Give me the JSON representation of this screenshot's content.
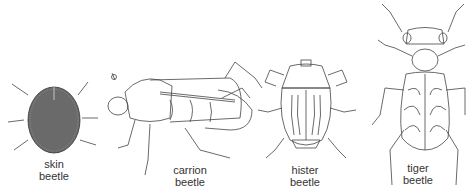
{
  "figure": {
    "beetles": [
      {
        "id": "skin",
        "line1": "skin",
        "line2": "beetle"
      },
      {
        "id": "carrion",
        "line1": "carrion",
        "line2": "beetle"
      },
      {
        "id": "hister",
        "line1": "hister",
        "line2": "beetle"
      },
      {
        "id": "tiger",
        "line1": "tiger",
        "line2": "beetle"
      }
    ],
    "colors": {
      "line": "#444444",
      "background": "#ffffff",
      "label": "#333333"
    }
  }
}
